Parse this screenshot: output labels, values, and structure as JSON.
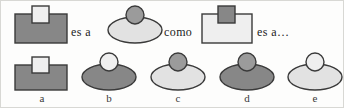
{
  "puzzle": {
    "type": "visual-analogy",
    "language": "es",
    "connectors": [
      {
        "text": "es a",
        "x": 70,
        "y": 24
      },
      {
        "text": "como",
        "x": 163,
        "y": 24
      },
      {
        "text": "es a…",
        "x": 256,
        "y": 24
      }
    ],
    "palette": {
      "dark_gray": "#878787",
      "mid_gray": "#9b9b9b",
      "light_gray": "#e2e2e2",
      "pale_gray": "#efefef",
      "outline": "#3a3a3a",
      "background": "#fdfdfc",
      "border": "#d8d8d4",
      "text": "#1c1c1c"
    },
    "stem": [
      {
        "name": "stem-figure-1",
        "body": {
          "shape": "rectangle",
          "fill": "dark_gray",
          "x": 14,
          "y": 13,
          "w": 52,
          "h": 29
        },
        "cap": {
          "shape": "square",
          "fill": "pale_gray",
          "x": 31,
          "y": 5,
          "w": 17,
          "h": 17
        }
      },
      {
        "name": "stem-figure-2",
        "body": {
          "shape": "ellipse",
          "fill": "light_gray",
          "cx": 134,
          "cy": 29,
          "rx": 27,
          "ry": 13
        },
        "cap": {
          "shape": "circle",
          "fill": "mid_gray",
          "cx": 134,
          "cy": 14,
          "r": 9
        }
      },
      {
        "name": "stem-figure-3",
        "body": {
          "shape": "rectangle",
          "fill": "pale_gray",
          "x": 201,
          "y": 13,
          "w": 50,
          "h": 29
        },
        "cap": {
          "shape": "square",
          "fill": "dark_gray",
          "x": 217,
          "y": 5,
          "w": 17,
          "h": 17
        }
      }
    ],
    "options": [
      {
        "label": "a",
        "name": "option-a",
        "label_x": 31,
        "body": {
          "shape": "rectangle",
          "fill": "dark_gray",
          "x": 14,
          "y": 64,
          "w": 52,
          "h": 25
        },
        "cap": {
          "shape": "square",
          "fill": "pale_gray",
          "x": 31,
          "y": 56,
          "w": 17,
          "h": 16
        }
      },
      {
        "label": "b",
        "name": "option-b",
        "label_x": 98,
        "body": {
          "shape": "ellipse",
          "fill": "dark_gray",
          "cx": 108,
          "cy": 76,
          "rx": 27,
          "ry": 13
        },
        "cap": {
          "shape": "circle",
          "fill": "pale_gray",
          "cx": 108,
          "cy": 61,
          "r": 9
        }
      },
      {
        "label": "c",
        "name": "option-c",
        "label_x": 167,
        "body": {
          "shape": "ellipse",
          "fill": "light_gray",
          "cx": 177,
          "cy": 76,
          "rx": 27,
          "ry": 13
        },
        "cap": {
          "shape": "circle",
          "fill": "mid_gray",
          "cx": 177,
          "cy": 61,
          "r": 9
        }
      },
      {
        "label": "d",
        "name": "option-d",
        "label_x": 236,
        "body": {
          "shape": "ellipse",
          "fill": "dark_gray",
          "cx": 246,
          "cy": 76,
          "rx": 27,
          "ry": 13
        },
        "cap": {
          "shape": "circle",
          "fill": "mid_gray",
          "cx": 246,
          "cy": 61,
          "r": 9
        }
      },
      {
        "label": "e",
        "name": "option-e",
        "label_x": 304,
        "body": {
          "shape": "ellipse",
          "fill": "light_gray",
          "cx": 314,
          "cy": 76,
          "rx": 27,
          "ry": 13
        },
        "cap": {
          "shape": "circle",
          "fill": "pale_gray",
          "cx": 314,
          "cy": 61,
          "r": 9
        }
      }
    ]
  }
}
